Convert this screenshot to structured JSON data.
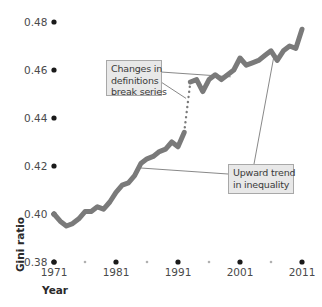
{
  "chart_data": {
    "type": "line",
    "title": "",
    "xlabel": "Year",
    "ylabel": "Gini ratio",
    "ylim": [
      0.38,
      0.48
    ],
    "xlim": [
      1971,
      2011
    ],
    "grid": false,
    "y_ticks": [
      "0.38",
      "0.40",
      "0.42",
      "0.44",
      "0.46",
      "0.48"
    ],
    "x_ticks": [
      "1971",
      "1981",
      "1991",
      "2001",
      "2011"
    ],
    "x_minor_ticks": [
      1976,
      1986,
      1996,
      2006
    ],
    "series": [
      {
        "name": "Gini ratio (before definition change)",
        "style": "solid",
        "color": "#7a7a7a",
        "x": [
          1971,
          1972,
          1973,
          1974,
          1975,
          1976,
          1977,
          1978,
          1979,
          1980,
          1981,
          1982,
          1983,
          1984,
          1985,
          1986,
          1987,
          1988,
          1989,
          1990,
          1991,
          1992
        ],
        "values": [
          0.4,
          0.397,
          0.395,
          0.396,
          0.398,
          0.401,
          0.401,
          0.403,
          0.402,
          0.405,
          0.409,
          0.412,
          0.413,
          0.416,
          0.421,
          0.423,
          0.424,
          0.426,
          0.427,
          0.43,
          0.428,
          0.434
        ]
      },
      {
        "name": "Break in series",
        "style": "dotted",
        "color": "#7a7a7a",
        "x": [
          1992,
          1993
        ],
        "values": [
          0.434,
          0.455
        ]
      },
      {
        "name": "Gini ratio (after definition change)",
        "style": "solid",
        "color": "#7a7a7a",
        "x": [
          1993,
          1994,
          1995,
          1996,
          1997,
          1998,
          1999,
          2000,
          2001,
          2002,
          2003,
          2004,
          2005,
          2006,
          2007,
          2008,
          2009,
          2010,
          2011
        ],
        "values": [
          0.455,
          0.456,
          0.451,
          0.456,
          0.458,
          0.456,
          0.458,
          0.46,
          0.465,
          0.462,
          0.463,
          0.464,
          0.466,
          0.468,
          0.464,
          0.468,
          0.47,
          0.469,
          0.477
        ]
      }
    ],
    "annotations": [
      {
        "id": "definitions",
        "lines": [
          "Changes in",
          "definitions",
          "break series"
        ],
        "points_to": [
          {
            "year": 1999.5,
            "value": 0.458
          },
          {
            "year": 1992.3,
            "value": 0.449
          }
        ]
      },
      {
        "id": "trend",
        "lines": [
          "Upward trend",
          "in inequality"
        ],
        "points_to": [
          {
            "year": 1985,
            "value": 0.42
          },
          {
            "year": 2006.5,
            "value": 0.467
          }
        ]
      }
    ]
  },
  "axes": {
    "y_title": "Gini ratio",
    "x_title": "Year"
  },
  "colors": {
    "line": "#7a7a7a",
    "tick_dot": "#1a1a1a",
    "minor_dot": "#b0b0b0",
    "annotation_bg": "#e8e8e8",
    "annotation_border": "#a8a8a8",
    "connector": "#6a6a6a"
  }
}
